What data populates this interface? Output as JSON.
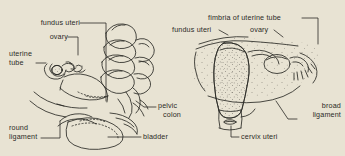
{
  "illustration": {
    "title": "Uterus anatomical line illustration",
    "background_color": "#e8e3d3",
    "ink_color": "#2b2a26",
    "figures": [
      {
        "id": "left-figure",
        "view": "lateral view of uterus, pelvic colon and bladder"
      },
      {
        "id": "right-figure",
        "view": "anterior view of uterus, broad ligament and ovaries"
      }
    ]
  },
  "labels": {
    "left": {
      "fundus_uteri": "fundus uteri",
      "ovary": "ovary",
      "uterine_tube_line1": "uterine",
      "uterine_tube_line2": "tube",
      "round_ligament_line1": "round",
      "round_ligament_line2": "ligament",
      "pelvic_colon_line1": "pelvic",
      "pelvic_colon_line2": "colon",
      "bladder": "bladder"
    },
    "right": {
      "fimbria": "fimbria of uterine tube",
      "fundus_uteri": "fundus uteri",
      "ovary": "ovary",
      "broad_ligament_line1": "broad",
      "broad_ligament_line2": "ligament",
      "cervix_uteri": "cervix uteri"
    }
  }
}
